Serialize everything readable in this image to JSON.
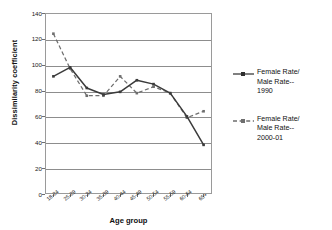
{
  "chart_data": {
    "type": "line",
    "title": "",
    "xlabel": "Age group",
    "ylabel": "Dissimilarity coefficient",
    "categories": [
      "18-24",
      "25-29",
      "30-34",
      "35-39",
      "40-44",
      "45-49",
      "50-54",
      "55-59",
      "60-64",
      "65+"
    ],
    "ylim": [
      0,
      140
    ],
    "yticks": [
      0,
      20,
      40,
      60,
      80,
      100,
      120,
      140
    ],
    "ytick_labels": [
      "0",
      "20",
      "40",
      "60",
      "80",
      "100",
      "120",
      "140"
    ],
    "grid": "horizontal",
    "legend_position": "right",
    "series": [
      {
        "name": "Female Rate/ Male Rate-- 1990",
        "style": "solid",
        "marker": "square",
        "color": "#3b3b3b",
        "values": [
          91,
          98,
          82,
          77,
          79,
          88,
          85,
          78,
          60,
          38
        ]
      },
      {
        "name": "Female Rate/ Male Rate-- 2000-01",
        "style": "dashed",
        "marker": "square",
        "color": "#6e6e6e",
        "values": [
          124,
          97,
          76,
          76,
          91,
          78,
          83,
          78,
          59,
          64
        ]
      }
    ]
  },
  "axes": {
    "y_title": "Dissimilarity coefficient",
    "x_title": "Age group",
    "y_tick_0": "0",
    "y_tick_1": "20",
    "y_tick_2": "40",
    "y_tick_3": "60",
    "y_tick_4": "80",
    "y_tick_5": "100",
    "y_tick_6": "120",
    "y_tick_7": "140",
    "x_tick_0": "18-24",
    "x_tick_1": "25-29",
    "x_tick_2": "30-34",
    "x_tick_3": "35-39",
    "x_tick_4": "40-44",
    "x_tick_5": "45-49",
    "x_tick_6": "50-54",
    "x_tick_7": "55-59",
    "x_tick_8": "60-64",
    "x_tick_9": "65+"
  },
  "legend": {
    "entries": [
      {
        "line1": "Female Rate/",
        "line2": "Male Rate--",
        "line3": "1990",
        "style": "solid"
      },
      {
        "line1": "Female Rate/",
        "line2": "Male Rate--",
        "line3": "2000-01",
        "style": "dashed"
      }
    ]
  },
  "colors": {
    "series_1990": "#3b3b3b",
    "series_2000": "#6e6e6e",
    "grid": "#8d8d8d",
    "frame": "#9a9a9a",
    "text": "#1a1a1a",
    "background": "#ffffff"
  }
}
